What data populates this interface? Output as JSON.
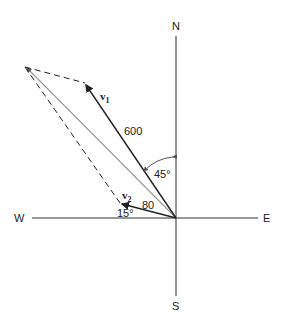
{
  "diagram": {
    "type": "vector-addition",
    "compass": {
      "north": "N",
      "south": "S",
      "east": "E",
      "west": "W"
    },
    "vectors": [
      {
        "name": "v",
        "subscript": "1",
        "magnitude": "600",
        "angle_label": "45°",
        "angle_reference": "from North toward West"
      },
      {
        "name": "v",
        "subscript": "2",
        "magnitude": "80",
        "angle_label": "15°",
        "angle_reference": "above West"
      }
    ],
    "resultant": {
      "style": "solid gray",
      "description": "v1 + v2"
    },
    "construction_lines": {
      "style": "dashed",
      "description": "parallelogram completion"
    }
  },
  "colors": {
    "line": "#222222",
    "resultant": "#999999",
    "background": "#ffffff"
  }
}
